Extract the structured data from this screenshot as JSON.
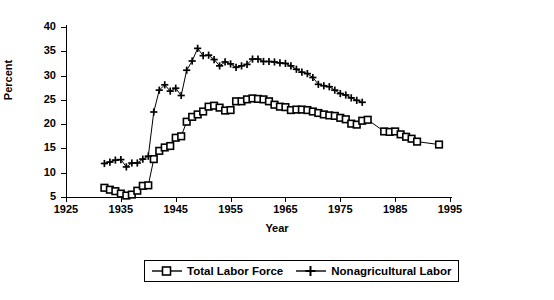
{
  "chart_data": {
    "type": "line",
    "title": "",
    "xlabel": "Year",
    "ylabel": "Percent",
    "xlim": [
      1925,
      1995
    ],
    "ylim": [
      5,
      40
    ],
    "xticks": [
      1925,
      1935,
      1945,
      1955,
      1965,
      1975,
      1985,
      1995
    ],
    "yticks": [
      5,
      10,
      15,
      20,
      25,
      30,
      35,
      40
    ],
    "grid": false,
    "legend_position": "bottom-center",
    "series": [
      {
        "name": "Total Labor Force",
        "marker": "square",
        "x": [
          1932,
          1933,
          1934,
          1935,
          1936,
          1937,
          1938,
          1939,
          1940,
          1941,
          1942,
          1943,
          1944,
          1945,
          1946,
          1947,
          1948,
          1949,
          1950,
          1951,
          1952,
          1953,
          1954,
          1955,
          1956,
          1957,
          1958,
          1959,
          1960,
          1961,
          1962,
          1963,
          1964,
          1965,
          1966,
          1967,
          1968,
          1969,
          1970,
          1971,
          1972,
          1973,
          1974,
          1975,
          1976,
          1977,
          1978,
          1979,
          1980,
          1983,
          1984,
          1985,
          1986,
          1987,
          1988,
          1989,
          1993
        ],
        "y": [
          6.9,
          6.5,
          6.2,
          5.7,
          5.3,
          5.5,
          6.3,
          7.3,
          7.4,
          12.8,
          14.5,
          15.2,
          15.5,
          17.2,
          17.5,
          20.5,
          21.5,
          22.0,
          22.6,
          23.6,
          23.8,
          23.4,
          22.8,
          22.9,
          24.7,
          24.7,
          25.1,
          25.3,
          25.2,
          25.1,
          24.7,
          24.0,
          23.6,
          23.5,
          22.9,
          23.0,
          23.0,
          22.9,
          22.6,
          22.3,
          22.0,
          21.8,
          21.7,
          21.3,
          21.0,
          20.1,
          19.9,
          20.7,
          20.9,
          18.5,
          18.4,
          18.5,
          17.9,
          17.4,
          17.0,
          16.4,
          15.8
        ]
      },
      {
        "name": "Nonagricultural Labor",
        "marker": "plus",
        "x": [
          1932,
          1933,
          1934,
          1935,
          1936,
          1937,
          1938,
          1939,
          1940,
          1941,
          1942,
          1943,
          1944,
          1945,
          1946,
          1947,
          1948,
          1949,
          1950,
          1951,
          1952,
          1953,
          1954,
          1955,
          1956,
          1957,
          1958,
          1959,
          1960,
          1961,
          1962,
          1963,
          1964,
          1965,
          1966,
          1967,
          1968,
          1969,
          1970,
          1971,
          1972,
          1973,
          1974,
          1975,
          1976,
          1977,
          1978,
          1979
        ],
        "y": [
          11.9,
          12.2,
          12.6,
          12.7,
          11.2,
          12.0,
          12.0,
          12.8,
          13.4,
          22.5,
          27.0,
          28.1,
          26.8,
          27.4,
          25.9,
          31.1,
          33.0,
          35.6,
          34.1,
          34.2,
          33.3,
          32.0,
          32.8,
          32.4,
          31.7,
          32.0,
          32.3,
          33.4,
          33.4,
          32.9,
          32.9,
          32.8,
          32.6,
          32.5,
          32.0,
          31.3,
          30.7,
          30.4,
          29.6,
          28.2,
          27.9,
          27.7,
          27.0,
          26.3,
          26.0,
          25.4,
          24.9,
          24.5
        ]
      }
    ]
  },
  "axes": {
    "y_title": "Percent",
    "x_title": "Year",
    "y_tick_labels": [
      "5",
      "10",
      "15",
      "20",
      "25",
      "30",
      "35",
      "40"
    ],
    "x_tick_labels": [
      "1925",
      "1935",
      "1945",
      "1955",
      "1965",
      "1975",
      "1985",
      "1995"
    ]
  },
  "legend": {
    "items": [
      {
        "label": "Total Labor Force",
        "marker": "square-marker"
      },
      {
        "label": "Nonagricultural Labor",
        "marker": "plus-marker"
      }
    ]
  }
}
